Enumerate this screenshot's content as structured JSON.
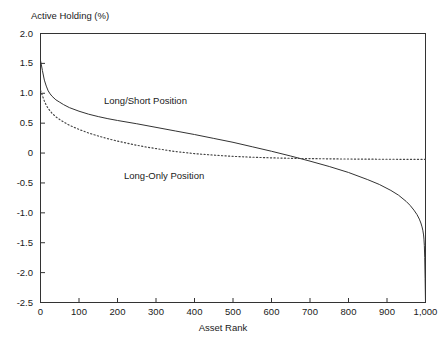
{
  "chart_data": {
    "type": "line",
    "title": "",
    "ylabel": "Active Holding (%)",
    "xlabel": "Asset Rank",
    "xlim": [
      0,
      1000
    ],
    "ylim": [
      -2.5,
      2.0
    ],
    "grid": false,
    "legend_position": "inline-annotations",
    "xticks": [
      "0",
      "100",
      "200",
      "300",
      "400",
      "500",
      "600",
      "700",
      "800",
      "900",
      "1,000"
    ],
    "xtick_values": [
      0,
      100,
      200,
      300,
      400,
      500,
      600,
      700,
      800,
      900,
      1000
    ],
    "yticks": [
      "2.0",
      "1.5",
      "1.0",
      "0.5",
      "0",
      "-0.5",
      "-1.0",
      "-1.5",
      "-2.0",
      "-2.5"
    ],
    "ytick_values": [
      2.0,
      1.5,
      1.0,
      0.5,
      0,
      -0.5,
      -1.0,
      -1.5,
      -2.0,
      -2.5
    ],
    "series": [
      {
        "name": "Long/Short Position",
        "style": "solid",
        "color": "#333333",
        "x": [
          0,
          5,
          10,
          15,
          20,
          25,
          30,
          40,
          50,
          60,
          75,
          100,
          125,
          150,
          175,
          200,
          250,
          300,
          350,
          400,
          450,
          500,
          550,
          600,
          650,
          700,
          750,
          800,
          850,
          880,
          910,
          930,
          950,
          960,
          970,
          978,
          984,
          988,
          991,
          993,
          995,
          996,
          997,
          998,
          999,
          1000
        ],
        "y": [
          1.55,
          1.38,
          1.22,
          1.12,
          1.04,
          0.99,
          0.95,
          0.89,
          0.85,
          0.81,
          0.76,
          0.7,
          0.65,
          0.61,
          0.575,
          0.545,
          0.49,
          0.43,
          0.37,
          0.31,
          0.245,
          0.18,
          0.105,
          0.03,
          -0.05,
          -0.135,
          -0.225,
          -0.325,
          -0.445,
          -0.525,
          -0.625,
          -0.705,
          -0.81,
          -0.875,
          -0.955,
          -1.03,
          -1.105,
          -1.17,
          -1.235,
          -1.29,
          -1.37,
          -1.44,
          -1.55,
          -1.75,
          -2.1,
          -2.5
        ]
      },
      {
        "name": "Long-Only Position",
        "style": "dotted",
        "color": "#444444",
        "x": [
          0,
          5,
          10,
          15,
          20,
          30,
          40,
          50,
          60,
          75,
          100,
          125,
          150,
          175,
          200,
          225,
          250,
          275,
          300,
          350,
          400,
          450,
          500,
          550,
          600,
          650,
          700,
          750,
          800,
          850,
          900,
          950,
          1000
        ],
        "y": [
          1.05,
          0.96,
          0.87,
          0.8,
          0.745,
          0.665,
          0.605,
          0.56,
          0.52,
          0.465,
          0.395,
          0.335,
          0.285,
          0.24,
          0.2,
          0.165,
          0.13,
          0.1,
          0.075,
          0.025,
          -0.01,
          -0.035,
          -0.055,
          -0.07,
          -0.08,
          -0.088,
          -0.093,
          -0.097,
          -0.1,
          -0.102,
          -0.104,
          -0.105,
          -0.106
        ]
      }
    ],
    "annotations": [
      {
        "text": "Long/Short Position",
        "x": 300,
        "y": 0.95
      },
      {
        "text": "Long-Only Position",
        "x": 400,
        "y": -0.35
      }
    ]
  }
}
